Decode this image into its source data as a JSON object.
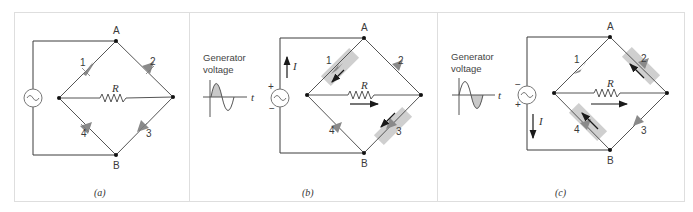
{
  "figure": {
    "panels": [
      {
        "id": "a",
        "caption": "(a)",
        "nodes": {
          "top": "A",
          "bottom": "B"
        },
        "resistor_label": "R",
        "diodes": [
          {
            "label": "1",
            "conducting": false
          },
          {
            "label": "2",
            "conducting": false
          },
          {
            "label": "3",
            "conducting": false
          },
          {
            "label": "4",
            "conducting": false
          }
        ],
        "show_waveform": false
      },
      {
        "id": "b",
        "caption": "(b)",
        "nodes": {
          "top": "A",
          "bottom": "B"
        },
        "resistor_label": "R",
        "waveform_title_line1": "Generator",
        "waveform_title_line2": "voltage",
        "waveform_axis_label": "t",
        "waveform_shaded_half": "positive",
        "polarity_top": "+",
        "polarity_bottom": "−",
        "current_label": "I",
        "current_direction": "up",
        "diodes": [
          {
            "label": "1",
            "conducting": true
          },
          {
            "label": "2",
            "conducting": false
          },
          {
            "label": "3",
            "conducting": true
          },
          {
            "label": "4",
            "conducting": false
          }
        ],
        "load_current_direction": "left-to-right"
      },
      {
        "id": "c",
        "caption": "(c)",
        "nodes": {
          "top": "A",
          "bottom": "B"
        },
        "resistor_label": "R",
        "waveform_title_line1": "Generator",
        "waveform_title_line2": "voltage",
        "waveform_axis_label": "t",
        "waveform_shaded_half": "negative",
        "polarity_top": "−",
        "polarity_bottom": "+",
        "current_label": "I",
        "current_direction": "down",
        "diodes": [
          {
            "label": "1",
            "conducting": false
          },
          {
            "label": "2",
            "conducting": true
          },
          {
            "label": "3",
            "conducting": false
          },
          {
            "label": "4",
            "conducting": true
          }
        ],
        "load_current_direction": "left-to-right"
      }
    ],
    "colors": {
      "wire": "#3c3c3c",
      "diode": "#8a8a8a",
      "highlight": "#c8c8c8",
      "waveform_fill": "#c9c9c9",
      "panel_border": "#dedede"
    }
  }
}
